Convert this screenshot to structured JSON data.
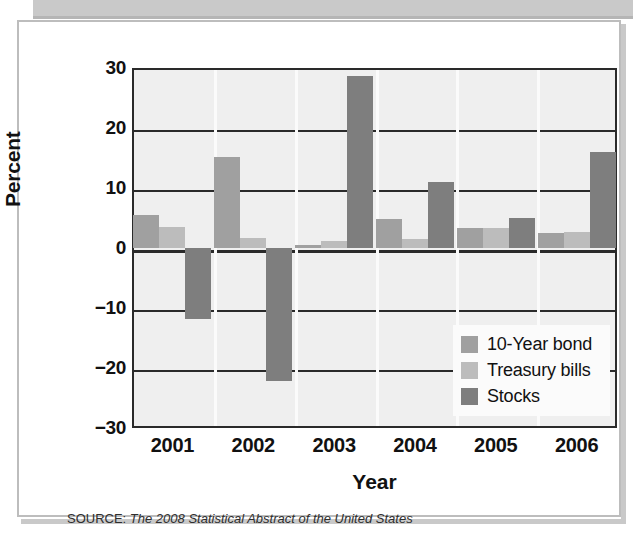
{
  "figure": {
    "source_keyword": "SOURCE:",
    "source_title": "The 2008 Statistical Abstract of the United States"
  },
  "legend": {
    "items": [
      {
        "label": "10-Year bond",
        "color": "#a0a0a0"
      },
      {
        "label": "Treasury bills",
        "color": "#bcbcbc"
      },
      {
        "label": "Stocks",
        "color": "#7e7e7e"
      }
    ]
  },
  "axis": {
    "y_ticks": [
      "30",
      "20",
      "10",
      "0",
      "−10",
      "−20",
      "−30"
    ],
    "y_title": "Percent",
    "x_title": "Year",
    "x_ticks": [
      "2001",
      "2002",
      "2003",
      "2004",
      "2005",
      "2006"
    ]
  },
  "chart_data": {
    "type": "bar",
    "title": "",
    "xlabel": "Year",
    "ylabel": "Percent",
    "ylim": [
      -30,
      30
    ],
    "ytick_values": [
      30,
      20,
      10,
      0,
      -10,
      -20,
      -30
    ],
    "grid": true,
    "legend_position": "inside-bottom-right",
    "categories": [
      "2001",
      "2002",
      "2003",
      "2004",
      "2005",
      "2006"
    ],
    "series": [
      {
        "name": "10-Year bond",
        "color": "#a0a0a0",
        "values": [
          5.5,
          15.2,
          0.5,
          4.9,
          3.3,
          2.5
        ]
      },
      {
        "name": "Treasury bills",
        "color": "#bcbcbc",
        "values": [
          3.5,
          1.7,
          1.1,
          1.5,
          3.4,
          2.6
        ]
      },
      {
        "name": "Stocks",
        "color": "#7e7e7e",
        "values": [
          -11.9,
          -22.1,
          28.7,
          11.0,
          5.0,
          16.0
        ]
      }
    ]
  }
}
